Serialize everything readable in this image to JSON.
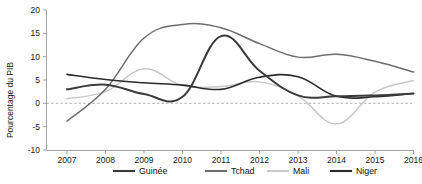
{
  "chart_data": {
    "type": "line",
    "title": "",
    "xlabel": "",
    "ylabel": "Pourcentage du PIB",
    "xlim": [
      2007,
      2016
    ],
    "ylim": [
      -10,
      20
    ],
    "grid": false,
    "legend_position": "bottom",
    "x_ticks": [
      "2007",
      "2008",
      "2009",
      "2010",
      "2011",
      "2012",
      "2013",
      "2014",
      "2015",
      "2016"
    ],
    "y_ticks": [
      "20",
      "15",
      "10",
      "5",
      "0",
      "-5",
      "-10"
    ],
    "zero_reference_line": 0,
    "x": [
      2007,
      2008,
      2009,
      2010,
      2011,
      2012,
      2013,
      2014,
      2015,
      2016
    ],
    "series": [
      {
        "name": "Guinée",
        "color": "#3b3b3b",
        "values": [
          3.0,
          4.0,
          2.0,
          1.4,
          14.4,
          7.0,
          1.7,
          1.5,
          1.7,
          2.1
        ]
      },
      {
        "name": "Tchad",
        "color": "#6e6e6e",
        "values": [
          -3.8,
          3.0,
          14.0,
          16.9,
          16.2,
          12.8,
          9.9,
          10.5,
          9.0,
          6.7
        ]
      },
      {
        "name": "Mali",
        "color": "#c9c9c9",
        "values": [
          1.0,
          2.5,
          7.4,
          3.8,
          3.6,
          4.6,
          1.6,
          -4.4,
          2.4,
          4.9
        ]
      },
      {
        "name": "Niger",
        "color": "#2b2b2b",
        "values": [
          6.2,
          5.1,
          4.4,
          3.9,
          3.0,
          5.6,
          5.7,
          1.5,
          1.4,
          2.1
        ]
      }
    ]
  },
  "legend": {
    "items": [
      {
        "label": "Guinée"
      },
      {
        "label": "Tchad"
      },
      {
        "label": "Mali"
      },
      {
        "label": "Niger"
      }
    ]
  },
  "axes": {
    "y_label": "Pourcentage du PIB"
  }
}
